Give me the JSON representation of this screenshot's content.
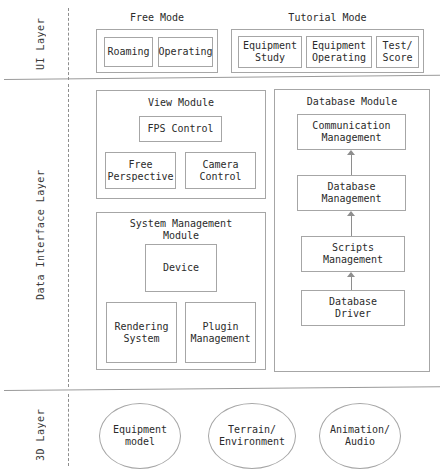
{
  "diagram": {
    "border_color": "#a6a6a6",
    "text_color": "#2b2b2b",
    "separator_color": "#9a9a9a",
    "dash_color": "#8e8e8e",
    "background": "#ffffff"
  },
  "layers": [
    {
      "id": "ui",
      "label": "UI Layer"
    },
    {
      "id": "data_interface",
      "label": "Data Interface Layer"
    },
    {
      "id": "three_d",
      "label": "3D Layer"
    }
  ],
  "ui_layer": {
    "groups": [
      {
        "caption": "Free Mode",
        "nodes": [
          {
            "label": "Roaming"
          },
          {
            "label": "Operating"
          }
        ]
      },
      {
        "caption": "Tutorial Mode",
        "nodes": [
          {
            "label": "Equipment\nStudy"
          },
          {
            "label": "Equipment\nOperating"
          },
          {
            "label": "Test/\nScore"
          }
        ]
      }
    ]
  },
  "data_interface_layer": {
    "modules": [
      {
        "title": "View Module",
        "nodes": [
          {
            "label": "FPS Control"
          },
          {
            "label": "Free\nPerspective"
          },
          {
            "label": "Camera\nControl"
          }
        ]
      },
      {
        "title": "System Management\nModule",
        "nodes": [
          {
            "label": "Device"
          },
          {
            "label": "Rendering\nSystem"
          },
          {
            "label": "Plugin\nManagement"
          }
        ]
      },
      {
        "title": "Database Module",
        "nodes": [
          {
            "label": "Communication\nManagement"
          },
          {
            "label": "Database\nManagement"
          },
          {
            "label": "Scripts\nManagement"
          },
          {
            "label": "Database\nDriver"
          }
        ],
        "connections": [
          {
            "from": "Database Driver",
            "to": "Scripts Management",
            "direction": "up"
          },
          {
            "from": "Scripts Management",
            "to": "Database Management",
            "direction": "up"
          },
          {
            "from": "Database Management",
            "to": "Communication Management",
            "direction": "up"
          }
        ]
      }
    ]
  },
  "three_d_layer": {
    "nodes": [
      {
        "label": "Equipment\nmodel",
        "shape": "ellipse"
      },
      {
        "label": "Terrain/\nEnvironment",
        "shape": "ellipse"
      },
      {
        "label": "Animation/\nAudio",
        "shape": "ellipse"
      }
    ]
  }
}
